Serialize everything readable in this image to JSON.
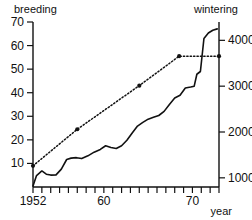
{
  "chart_data": {
    "type": "line",
    "title": "",
    "subtitle": "",
    "xlabel": "year",
    "ylabel": "breeding",
    "y2label": "wintering",
    "grid": false,
    "legend": "none",
    "xlim": [
      1952,
      1973
    ],
    "ylim": [
      0,
      70
    ],
    "y2lim": [
      800,
      4400
    ],
    "x_ticks": [
      1952,
      1953,
      1954,
      1955,
      1956,
      1957,
      1958,
      1959,
      1960,
      1961,
      1962,
      1963,
      1964,
      1965,
      1966,
      1967,
      1968,
      1969,
      1970,
      1971,
      1972,
      1973
    ],
    "x_tick_labels": [
      {
        "x": 1952,
        "label": "1952"
      },
      {
        "x": 1960,
        "label": "60"
      },
      {
        "x": 1970,
        "label": "70"
      }
    ],
    "y_ticks": [
      10,
      20,
      30,
      40,
      50,
      60,
      70
    ],
    "y_tick_labels": [
      "10",
      "20",
      "30",
      "40",
      "50",
      "60",
      "70"
    ],
    "y2_ticks": [
      1000,
      2000,
      3000,
      4000
    ],
    "y2_tick_labels": [
      "1000",
      "2000",
      "3000",
      "4000"
    ],
    "series": [
      {
        "name": "wintering",
        "style": "solid",
        "axis": "right",
        "markers": false,
        "x": [
          1952,
          1952.4,
          1953,
          1953.5,
          1954,
          1954.6,
          1955.2,
          1955.8,
          1956.3,
          1956.9,
          1957.5,
          1958.2,
          1958.9,
          1959.6,
          1960.2,
          1960.8,
          1961.4,
          1962.0,
          1962.6,
          1963.2,
          1963.8,
          1964.4,
          1965.0,
          1965.6,
          1966.2,
          1966.8,
          1967.4,
          1968.0,
          1968.6,
          1969.2,
          1969.8,
          1970.2,
          1970.5,
          1970.9,
          1971.3,
          1971.8,
          1972.3,
          1972.8
        ],
        "values": [
          820,
          1050,
          1150,
          1080,
          1060,
          1065,
          1190,
          1400,
          1430,
          1440,
          1420,
          1480,
          1560,
          1620,
          1700,
          1660,
          1640,
          1700,
          1820,
          1980,
          2130,
          2210,
          2280,
          2320,
          2360,
          2450,
          2600,
          2740,
          2800,
          2960,
          2980,
          3000,
          3260,
          3320,
          4040,
          4160,
          4220,
          4250
        ]
      },
      {
        "name": "breeding",
        "style": "dotted",
        "axis": "left",
        "markers": true,
        "x": [
          1952,
          1957,
          1964,
          1968.5,
          1973
        ],
        "values": [
          9,
          24.5,
          43,
          55.5,
          55.5
        ]
      }
    ],
    "annotations": []
  },
  "labels": {
    "left_axis_title": "breeding",
    "right_axis_title": "wintering",
    "x_axis_name": "year"
  }
}
